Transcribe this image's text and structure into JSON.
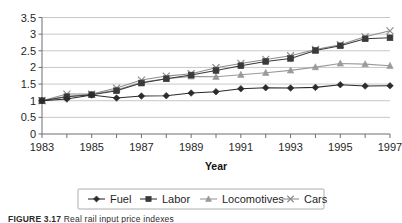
{
  "figure": {
    "caption_label": "FIGURE 3.17",
    "caption_text": "Real rail input price indexes"
  },
  "chart_data": {
    "type": "line",
    "title": "",
    "subtitle": "",
    "xlabel": "Year",
    "ylabel": "",
    "x": [
      1983,
      1984,
      1985,
      1986,
      1987,
      1988,
      1989,
      1990,
      1991,
      1992,
      1993,
      1994,
      1995,
      1996,
      1997
    ],
    "categories": [
      "1983",
      "1984",
      "1985",
      "1986",
      "1987",
      "1988",
      "1989",
      "1990",
      "1991",
      "1992",
      "1993",
      "1994",
      "1995",
      "1996",
      "1997"
    ],
    "xtick_labels": [
      "1983",
      "",
      "1985",
      "",
      "1987",
      "",
      "1989",
      "",
      "1991",
      "",
      "1993",
      "",
      "1995",
      "",
      "1997"
    ],
    "ytick_labels": [
      "0",
      "0.5",
      "1",
      "1.5",
      "2",
      "2.5",
      "3",
      "3.5"
    ],
    "ytick_values": [
      0,
      0.5,
      1,
      1.5,
      2,
      2.5,
      3,
      3.5
    ],
    "xlim": [
      1983,
      1997
    ],
    "ylim": [
      0,
      3.5
    ],
    "grid": "horizontal",
    "legend_position": "bottom",
    "series": [
      {
        "name": "Fuel",
        "marker": "diamond",
        "color": "#2b2b2b",
        "values": [
          1.0,
          1.05,
          1.17,
          1.08,
          1.14,
          1.15,
          1.23,
          1.27,
          1.36,
          1.39,
          1.38,
          1.4,
          1.48,
          1.44,
          1.45
        ]
      },
      {
        "name": "Labor",
        "marker": "square",
        "color": "#3a3a3a",
        "values": [
          1.0,
          1.12,
          1.18,
          1.3,
          1.53,
          1.66,
          1.77,
          1.91,
          2.05,
          2.18,
          2.27,
          2.51,
          2.65,
          2.86,
          2.89
        ]
      },
      {
        "name": "Locomotives",
        "marker": "triangle",
        "color": "#9a9a9a",
        "values": [
          1.0,
          1.13,
          1.19,
          1.32,
          1.55,
          1.66,
          1.73,
          1.72,
          1.78,
          1.84,
          1.91,
          2.01,
          2.12,
          2.1,
          2.05
        ]
      },
      {
        "name": "Cars",
        "marker": "cross",
        "color": "#8d8d8d",
        "values": [
          1.0,
          1.2,
          1.2,
          1.38,
          1.62,
          1.74,
          1.81,
          1.99,
          2.12,
          2.24,
          2.35,
          2.54,
          2.68,
          2.92,
          3.1
        ]
      }
    ]
  }
}
